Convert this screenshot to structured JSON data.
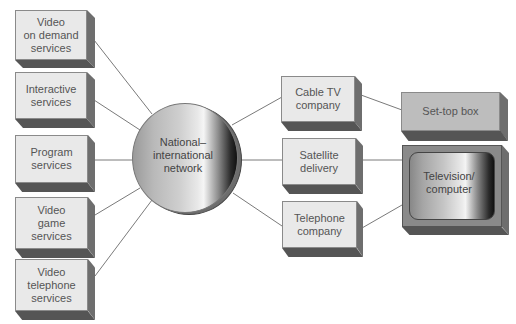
{
  "diagram": {
    "hub": {
      "label": "National–\ninternational\nnetwork"
    },
    "services": [
      {
        "id": "vod",
        "label": "Video\non demand\nservices"
      },
      {
        "id": "interactive",
        "label": "Interactive\nservices"
      },
      {
        "id": "program",
        "label": "Program\nservices"
      },
      {
        "id": "game",
        "label": "Video\ngame\nservices"
      },
      {
        "id": "telephone_services",
        "label": "Video\ntelephone\nservices"
      }
    ],
    "carriers": [
      {
        "id": "cable",
        "label": "Cable TV\ncompany"
      },
      {
        "id": "satellite",
        "label": "Satellite\ndelivery"
      },
      {
        "id": "telco",
        "label": "Telephone\ncompany"
      }
    ],
    "devices": [
      {
        "id": "settop",
        "label": "Set-top box"
      },
      {
        "id": "tv",
        "label": "Television/\ncomputer"
      }
    ],
    "edges": [
      [
        "vod",
        "hub"
      ],
      [
        "interactive",
        "hub"
      ],
      [
        "program",
        "hub"
      ],
      [
        "game",
        "hub"
      ],
      [
        "telephone_services",
        "hub"
      ],
      [
        "hub",
        "cable"
      ],
      [
        "hub",
        "satellite"
      ],
      [
        "hub",
        "telco"
      ],
      [
        "cable",
        "settop"
      ],
      [
        "satellite",
        "tv"
      ],
      [
        "telco",
        "tv"
      ]
    ]
  },
  "colors": {
    "box_face": "#e9e9e9",
    "box_side": "#6e6e6e",
    "box_bottom": "#555555",
    "settop_face": "#bdbdbd",
    "line": "#777777",
    "text": "#555555"
  }
}
